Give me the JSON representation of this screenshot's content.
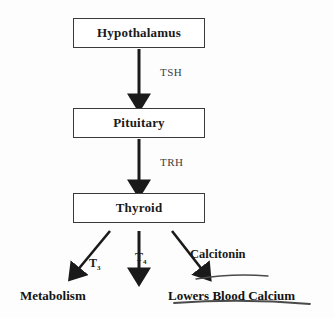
{
  "diagram": {
    "background_color": "#fdfdfd",
    "line_color": "#1a1a1a",
    "box_border_color": "#3a3a3a",
    "nodes": [
      {
        "id": "hypothalamus",
        "label": "Hypothalamus"
      },
      {
        "id": "pituitary",
        "label": "Pituitary"
      },
      {
        "id": "thyroid",
        "label": "Thyroid"
      }
    ],
    "edge_labels": [
      {
        "id": "tsh",
        "label": "TSH"
      },
      {
        "id": "trh",
        "label": "TRH"
      }
    ],
    "hormones": [
      {
        "id": "t3",
        "label": "T",
        "subscript": "3"
      },
      {
        "id": "t4",
        "label": "T",
        "subscript": "4"
      },
      {
        "id": "calcitonin",
        "label": "Calcitonin"
      }
    ],
    "outcomes": [
      {
        "id": "metabolism",
        "label": "Metabolism"
      },
      {
        "id": "lowers-calcium",
        "label": "Lowers Blood Calcium"
      }
    ]
  }
}
